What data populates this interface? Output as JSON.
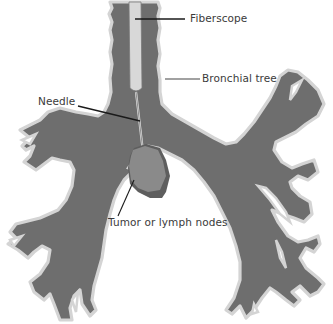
{
  "diagram": {
    "type": "medical-illustration",
    "labels": {
      "fiberscope": "Fiberscope",
      "bronchial_tree": "Bronchial tree",
      "needle": "Needle",
      "tumor": "Tumor or lymph nodes"
    },
    "colors": {
      "airway_fill": "#6e6e6e",
      "airway_wall": "#d4d4d4",
      "fiberscope": "#d8d8d8",
      "tumor_fill": "#8a8a8a",
      "tumor_shadow": "#5e5e5e",
      "leader_line": "#1a1a1a",
      "text": "#3a3a3a"
    }
  }
}
